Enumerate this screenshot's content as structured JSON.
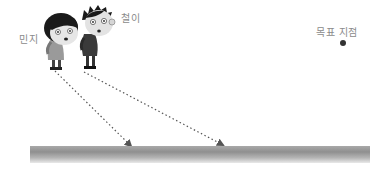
{
  "labels": {
    "minji": "민지",
    "cheol": "철이",
    "target": "목표 지점"
  },
  "characters": [
    {
      "name": "민지",
      "role": "girl",
      "head_center": [
        63,
        30
      ],
      "arrow_start": [
        55,
        70
      ],
      "arrow_end": [
        133,
        148
      ]
    },
    {
      "name": "철이",
      "role": "boy",
      "head_center": [
        97,
        22
      ],
      "arrow_start": [
        83,
        72
      ],
      "arrow_end": [
        225,
        146
      ]
    }
  ],
  "target_point": {
    "label": "목표 지점",
    "position": [
      343,
      43
    ]
  },
  "ground": {
    "x_range": [
      30,
      370
    ],
    "y_range": [
      146,
      163
    ]
  },
  "colors": {
    "label": "#8a8a8a",
    "arrow": "#555555",
    "ground_dark": "#8f8f8f",
    "ground_light": "#e9e9e9",
    "target_dot": "#333333"
  }
}
